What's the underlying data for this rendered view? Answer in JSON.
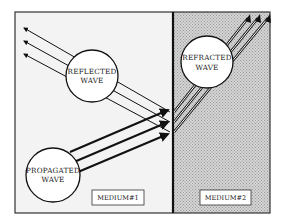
{
  "diagram": {
    "type": "wave-refraction",
    "labels": {
      "reflected": [
        "REFLECTED",
        "WAVE"
      ],
      "refracted": [
        "REFRACTED",
        "WAVE"
      ],
      "propagated": [
        "PROPAGATED",
        "WAVE"
      ],
      "medium1": "MEDIUM#1",
      "medium2": "MEDIUM#2"
    },
    "colors": {
      "medium1_fill": "#f2f2f2",
      "medium2_fill": "#c8c8c8",
      "line": "#111111"
    }
  }
}
